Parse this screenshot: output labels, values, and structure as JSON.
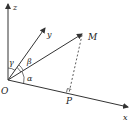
{
  "diagram": {
    "type": "3d-coordinate-direction-angles",
    "colors": {
      "line": "#333333",
      "background": "#ffffff"
    },
    "axes": [
      {
        "name": "z",
        "label": "z"
      },
      {
        "name": "y",
        "label": "y"
      },
      {
        "name": "x",
        "label": "x"
      }
    ],
    "points": [
      {
        "name": "origin",
        "label": "O"
      },
      {
        "name": "M",
        "label": "M"
      },
      {
        "name": "P",
        "label": "P"
      }
    ],
    "angles": [
      {
        "name": "alpha",
        "label": "α"
      },
      {
        "name": "beta",
        "label": "β"
      },
      {
        "name": "gamma",
        "label": "γ"
      }
    ],
    "segments": [
      {
        "name": "OM",
        "style": "solid",
        "arrow": true
      },
      {
        "name": "MP",
        "style": "dashed"
      }
    ],
    "right_angle_at": "P"
  }
}
